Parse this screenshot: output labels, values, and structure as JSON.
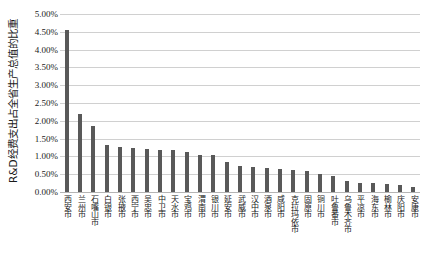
{
  "chart_data": {
    "type": "bar",
    "title": "",
    "xlabel": "",
    "ylabel": "R&D经费支出占全省生产总值的比重",
    "ylim": [
      0,
      5.0
    ],
    "yunit": "%",
    "ytick_labels": [
      "5.00%",
      "4.50%",
      "4.00%",
      "3.50%",
      "3.00%",
      "2.50%",
      "2.00%",
      "1.50%",
      "1.00%",
      "0.50%",
      "0.00%"
    ],
    "ytick_values": [
      5.0,
      4.5,
      4.0,
      3.5,
      3.0,
      2.5,
      2.0,
      1.5,
      1.0,
      0.5,
      0.0
    ],
    "grid": true,
    "legend": "none",
    "bar_color": "#595959",
    "grid_color": "#d0d0d0",
    "background_color": "#ffffff",
    "categories": [
      "西安市",
      "兰州市",
      "石嘴山市",
      "白银市",
      "张掖市",
      "西宁市",
      "吴忠市",
      "中卫市",
      "天水市",
      "宝鸡市",
      "渭南市",
      "银川市",
      "延安市",
      "武威市",
      "汉中市",
      "酒泉市",
      "咸阳市",
      "克拉玛依市",
      "固原市",
      "铜川市",
      "吐鲁番市",
      "乌鲁木齐市",
      "平凉市",
      "海东市",
      "榆林市",
      "庆阳市",
      "安康市"
    ],
    "values": [
      4.55,
      2.2,
      1.85,
      1.32,
      1.26,
      1.24,
      1.22,
      1.18,
      1.17,
      1.11,
      1.05,
      1.03,
      0.83,
      0.72,
      0.7,
      0.68,
      0.64,
      0.62,
      0.6,
      0.52,
      0.44,
      0.3,
      0.26,
      0.24,
      0.22,
      0.2,
      0.15
    ]
  }
}
